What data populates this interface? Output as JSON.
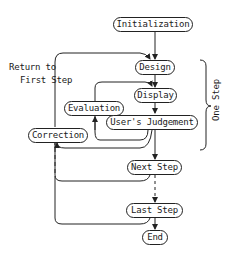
{
  "diagram": {
    "type": "flowchart",
    "nodes": {
      "initialization": "Initialization",
      "design": "Design",
      "display": "Display",
      "evaluation": "Evaluation",
      "users_judgement": "User's Judgement",
      "correction": "Correction",
      "next_step": "Next Step",
      "last_step": "Last Step",
      "end": "End"
    },
    "annotations": {
      "return_line1": "Return to",
      "return_line2": "First Step",
      "one_step": "One Step"
    },
    "edges": [
      {
        "from": "Initialization",
        "to": "Design"
      },
      {
        "from": "Design",
        "to": "Display"
      },
      {
        "from": "Display",
        "to": "User's Judgement"
      },
      {
        "from": "User's Judgement",
        "to": "Evaluation"
      },
      {
        "from": "Evaluation",
        "to": "Display"
      },
      {
        "from": "User's Judgement",
        "to": "Correction"
      },
      {
        "from": "User's Judgement",
        "to": "Next Step"
      },
      {
        "from": "Next Step",
        "to": "Correction"
      },
      {
        "from": "Next Step",
        "to": "Last Step",
        "style": "dashed"
      },
      {
        "from": "Last Step",
        "to": "Correction",
        "style": "dashed"
      },
      {
        "from": "Correction",
        "to": "Design",
        "label": "Return to First Step"
      },
      {
        "from": "Last Step",
        "to": "End"
      }
    ],
    "colors": {
      "line": "#222222",
      "background": "#ffffff"
    }
  }
}
